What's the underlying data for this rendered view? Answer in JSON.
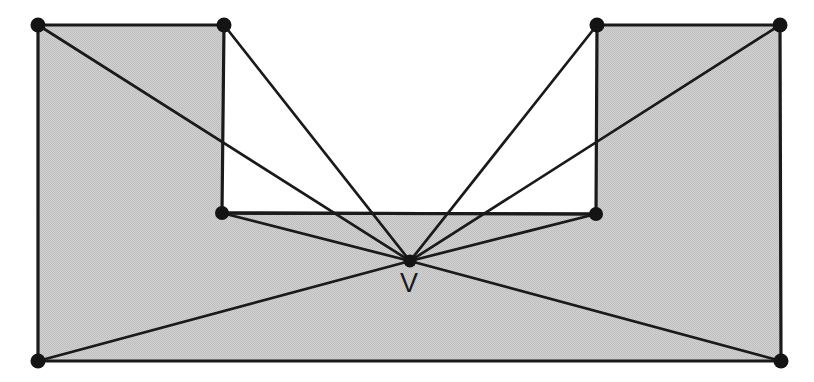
{
  "figure": {
    "type": "polygon-visibility-diagram",
    "canvas": {
      "width": 814,
      "height": 382
    },
    "colors": {
      "fill_gray": "#c9c9c9",
      "stroke_black": "#1a1a1a",
      "background_white": "#ffffff",
      "notch_interior_white": "#ffffff"
    },
    "labels": [
      {
        "id": "v-label",
        "text": "V",
        "x": 409,
        "y": 292
      }
    ],
    "polygon_outline": [
      {
        "id": "p0",
        "name": "top-left-corner",
        "x": 38,
        "y": 25
      },
      {
        "id": "p1",
        "name": "notch-top-left",
        "x": 224,
        "y": 25
      },
      {
        "id": "p2",
        "name": "notch-bottom-left",
        "x": 222,
        "y": 213
      },
      {
        "id": "p3",
        "name": "notch-bottom-right",
        "x": 596,
        "y": 214
      },
      {
        "id": "p4",
        "name": "notch-top-right",
        "x": 597,
        "y": 25
      },
      {
        "id": "p5",
        "name": "top-right-corner",
        "x": 780,
        "y": 25
      },
      {
        "id": "p6",
        "name": "bottom-right-corner",
        "x": 781,
        "y": 361
      },
      {
        "id": "p7",
        "name": "bottom-left-corner",
        "x": 38,
        "y": 361
      }
    ],
    "viewpoint": {
      "id": "v",
      "name": "viewpoint-v",
      "x": 410,
      "y": 261
    },
    "vertex_dots": [
      {
        "id": "dot-top-left",
        "x": 38,
        "y": 25,
        "r": 7.5
      },
      {
        "id": "dot-notch-top-left",
        "x": 224,
        "y": 25,
        "r": 7.5
      },
      {
        "id": "dot-notch-top-right",
        "x": 597,
        "y": 25,
        "r": 7.5
      },
      {
        "id": "dot-top-right",
        "x": 780,
        "y": 25,
        "r": 7.5
      },
      {
        "id": "dot-notch-bottom-left",
        "x": 222,
        "y": 213,
        "r": 7.0
      },
      {
        "id": "dot-notch-bottom-right",
        "x": 596,
        "y": 214,
        "r": 7.0
      },
      {
        "id": "dot-bottom-left",
        "x": 38,
        "y": 361,
        "r": 7.5
      },
      {
        "id": "dot-bottom-right",
        "x": 781,
        "y": 361,
        "r": 7.5
      },
      {
        "id": "dot-viewpoint-v",
        "x": 410,
        "y": 261,
        "r": 6.5
      }
    ],
    "visibility_rays": [
      {
        "id": "ray-v-to-top-left",
        "x1": 410,
        "y1": 261,
        "x2": 38,
        "y2": 25
      },
      {
        "id": "ray-v-to-notch-top-left",
        "x1": 410,
        "y1": 261,
        "x2": 224,
        "y2": 25
      },
      {
        "id": "ray-v-to-notch-bottom-left",
        "x1": 410,
        "y1": 261,
        "x2": 222,
        "y2": 213
      },
      {
        "id": "ray-v-to-bottom-left",
        "x1": 410,
        "y1": 261,
        "x2": 38,
        "y2": 361
      },
      {
        "id": "ray-v-to-bottom-right",
        "x1": 410,
        "y1": 261,
        "x2": 781,
        "y2": 361
      },
      {
        "id": "ray-v-to-notch-bottom-right",
        "x1": 410,
        "y1": 261,
        "x2": 596,
        "y2": 214
      },
      {
        "id": "ray-v-to-notch-top-right",
        "x1": 410,
        "y1": 261,
        "x2": 597,
        "y2": 25
      },
      {
        "id": "ray-v-to-top-right",
        "x1": 410,
        "y1": 261,
        "x2": 780,
        "y2": 25
      }
    ],
    "notch_base_edge": {
      "id": "notch-base",
      "x1": 222,
      "y1": 213,
      "x2": 596,
      "y2": 214
    }
  }
}
